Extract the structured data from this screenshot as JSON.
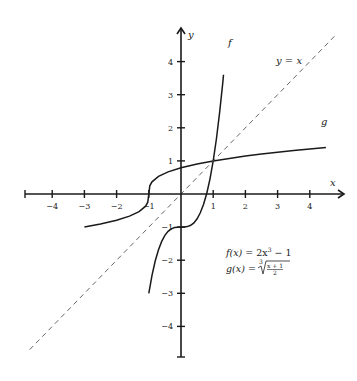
{
  "chart_data": {
    "type": "line",
    "title": "",
    "xlabel": "x",
    "ylabel": "y",
    "xlim": [
      -5,
      5
    ],
    "ylim": [
      -5,
      5
    ],
    "grid": false,
    "x_ticks": [
      -4,
      -3,
      -2,
      -1,
      1,
      2,
      3,
      4
    ],
    "y_ticks": [
      -4,
      -3,
      -2,
      -1,
      1,
      2,
      3,
      4
    ],
    "x_tick_labels": [
      "−4",
      "−3",
      "−2",
      "−1",
      "1",
      "2",
      "3",
      "4"
    ],
    "y_tick_labels": [
      "−4",
      "−3",
      "−2",
      "−1",
      "1",
      "2",
      "3",
      "4"
    ],
    "series": [
      {
        "name": "f",
        "formula": "f(x) = 2x^3 - 1",
        "style": "solid",
        "label": "f",
        "x": [
          -1.0,
          -0.9,
          -0.8,
          -0.7,
          -0.6,
          -0.5,
          -0.4,
          -0.3,
          -0.2,
          -0.1,
          0.0,
          0.1,
          0.2,
          0.3,
          0.4,
          0.5,
          0.6,
          0.7,
          0.8,
          0.9,
          1.0,
          1.1,
          1.2,
          1.3,
          1.32
        ],
        "y": [
          -3.0,
          -2.458,
          -2.024,
          -1.686,
          -1.432,
          -1.25,
          -1.128,
          -1.054,
          -1.016,
          -1.002,
          -1.0,
          -0.998,
          -0.984,
          -0.946,
          -0.872,
          -0.75,
          -0.568,
          -0.314,
          0.024,
          0.458,
          1.0,
          1.662,
          2.456,
          3.394,
          3.6
        ]
      },
      {
        "name": "g",
        "formula": "g(x) = cbrt((x+1)/2)",
        "style": "solid",
        "label": "g",
        "x": [
          -3.0,
          -2.5,
          -2.0,
          -1.6,
          -1.3,
          -1.1,
          -1.03,
          -1.0,
          -0.97,
          -0.9,
          -0.7,
          -0.4,
          0.0,
          0.5,
          1.0,
          1.5,
          2.0,
          2.5,
          3.0,
          3.5,
          4.0,
          4.5
        ],
        "y": [
          -1.0,
          -0.909,
          -0.794,
          -0.669,
          -0.531,
          -0.368,
          -0.247,
          0.0,
          0.247,
          0.368,
          0.531,
          0.669,
          0.794,
          0.909,
          1.0,
          1.077,
          1.145,
          1.205,
          1.26,
          1.31,
          1.357,
          1.401
        ]
      },
      {
        "name": "y = x",
        "formula": "y = x",
        "style": "dashed",
        "label": "y = x",
        "x": [
          -4.7,
          4.8
        ],
        "y": [
          -4.7,
          4.8
        ]
      }
    ],
    "annotations": [
      {
        "text": "f(x) = 2x³ − 1"
      },
      {
        "text": "g(x) = ∛((x + 1)/2)"
      }
    ]
  },
  "labels": {
    "x_axis": "x",
    "y_axis": "y",
    "f": "f",
    "g": "g",
    "identity": "y = x",
    "eq_f_lhs": "f(x)",
    "eq_f_rhs_a": " = 2x",
    "eq_f_exp": "3",
    "eq_f_rhs_b": " − 1",
    "eq_g_lhs": "g(x)",
    "eq_g_eq": " = ",
    "eq_g_root_index": "3",
    "eq_g_num": "x + 1",
    "eq_g_den": "2"
  }
}
